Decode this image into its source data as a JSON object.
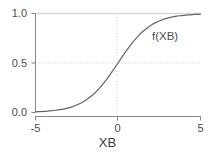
{
  "chart_data": {
    "type": "line",
    "title": "",
    "subtitle": "",
    "xlabel": "XB",
    "ylabel": "",
    "xlim": [
      -5,
      5
    ],
    "ylim": [
      0.0,
      1.0
    ],
    "grid": true,
    "gridlines": {
      "horizontal": [
        {
          "value": 1.0,
          "style": "solid",
          "color": "#d9d9d9"
        },
        {
          "value": 0.5,
          "style": "dotted",
          "color": "#cccccc"
        }
      ],
      "vertical": [
        {
          "value": 0,
          "style": "dotted",
          "color": "#cccccc"
        }
      ]
    },
    "xticks": [
      -5,
      0,
      5
    ],
    "xtick_labels": [
      "-5",
      "0",
      "5"
    ],
    "yticks": [
      0.0,
      0.5,
      1.0
    ],
    "ytick_labels": [
      "0.0",
      "0.5",
      "1.0"
    ],
    "legend": null,
    "annotations": [
      {
        "text": "f(XB)",
        "x": 2.1,
        "y": 0.82
      }
    ],
    "series": [
      {
        "name": "f(XB)",
        "color": "#666666",
        "linewidth": 1.2,
        "equation": "1 / (1 + exp(-x))",
        "x": [
          -5.0,
          -4.75,
          -4.5,
          -4.25,
          -4.0,
          -3.75,
          -3.5,
          -3.25,
          -3.0,
          -2.75,
          -2.5,
          -2.25,
          -2.0,
          -1.75,
          -1.5,
          -1.25,
          -1.0,
          -0.75,
          -0.5,
          -0.25,
          0.0,
          0.25,
          0.5,
          0.75,
          1.0,
          1.25,
          1.5,
          1.75,
          2.0,
          2.25,
          2.5,
          2.75,
          3.0,
          3.25,
          3.5,
          3.75,
          4.0,
          4.25,
          4.5,
          4.75,
          5.0
        ],
        "values": [
          0.007,
          0.009,
          0.011,
          0.014,
          0.018,
          0.023,
          0.029,
          0.037,
          0.047,
          0.06,
          0.076,
          0.095,
          0.119,
          0.148,
          0.182,
          0.223,
          0.269,
          0.321,
          0.378,
          0.438,
          0.5,
          0.562,
          0.622,
          0.679,
          0.731,
          0.777,
          0.818,
          0.852,
          0.881,
          0.905,
          0.924,
          0.94,
          0.953,
          0.963,
          0.971,
          0.977,
          0.982,
          0.986,
          0.989,
          0.991,
          0.993
        ]
      }
    ]
  },
  "axes": {
    "x_title": "XB",
    "ytick_1": "1.0",
    "ytick_2": "0.5",
    "ytick_3": "0.0",
    "xtick_1": "-5",
    "xtick_2": "0",
    "xtick_3": "5"
  },
  "labels": {
    "curve_annotation": "f(XB)"
  },
  "colors": {
    "curve": "#666666",
    "axis": "#808080",
    "grid_solid": "#d9d9d9",
    "grid_dotted": "#cccccc",
    "text": "#4d4d4d",
    "background": "#ffffff"
  }
}
